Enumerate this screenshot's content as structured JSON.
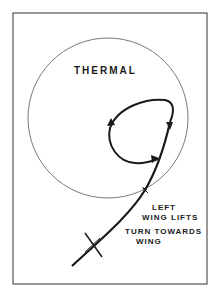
{
  "diagram": {
    "title_label": "THERMAL",
    "annotation_line1": "LEFT",
    "annotation_line2": "WING LIFTS",
    "annotation_line3": "TURN TOWARDS",
    "annotation_line4": "WING",
    "colors": {
      "line": "#1a1a1a",
      "circle": "#555555",
      "frame": "#333333",
      "background": "#ffffff"
    }
  }
}
